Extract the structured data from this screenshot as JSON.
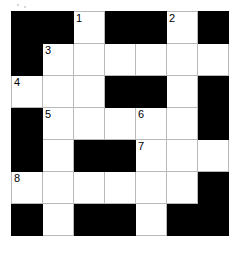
{
  "puzzle": {
    "type": "crossword-grid",
    "rows": 7,
    "columns": 7,
    "cell_size_px": 31,
    "colors": {
      "block": "#000000",
      "open": "#ffffff",
      "grid_line": "#b9b9b9",
      "number_text": "#000000",
      "page_background": "#ffffff"
    },
    "grid": [
      [
        {
          "state": "block",
          "number": ""
        },
        {
          "state": "block",
          "number": ""
        },
        {
          "state": "open",
          "number": "1"
        },
        {
          "state": "block",
          "number": ""
        },
        {
          "state": "block",
          "number": ""
        },
        {
          "state": "open",
          "number": "2"
        },
        {
          "state": "block",
          "number": ""
        }
      ],
      [
        {
          "state": "block",
          "number": ""
        },
        {
          "state": "open",
          "number": "3"
        },
        {
          "state": "open",
          "number": ""
        },
        {
          "state": "open",
          "number": ""
        },
        {
          "state": "open",
          "number": ""
        },
        {
          "state": "open",
          "number": ""
        },
        {
          "state": "open",
          "number": ""
        }
      ],
      [
        {
          "state": "open",
          "number": "4"
        },
        {
          "state": "open",
          "number": ""
        },
        {
          "state": "open",
          "number": ""
        },
        {
          "state": "block",
          "number": ""
        },
        {
          "state": "block",
          "number": ""
        },
        {
          "state": "open",
          "number": ""
        },
        {
          "state": "block",
          "number": ""
        }
      ],
      [
        {
          "state": "block",
          "number": ""
        },
        {
          "state": "open",
          "number": "5"
        },
        {
          "state": "open",
          "number": ""
        },
        {
          "state": "open",
          "number": ""
        },
        {
          "state": "open",
          "number": "6"
        },
        {
          "state": "open",
          "number": ""
        },
        {
          "state": "block",
          "number": ""
        }
      ],
      [
        {
          "state": "block",
          "number": ""
        },
        {
          "state": "open",
          "number": ""
        },
        {
          "state": "block",
          "number": ""
        },
        {
          "state": "block",
          "number": ""
        },
        {
          "state": "open",
          "number": "7"
        },
        {
          "state": "open",
          "number": ""
        },
        {
          "state": "open",
          "number": ""
        }
      ],
      [
        {
          "state": "open",
          "number": "8"
        },
        {
          "state": "open",
          "number": ""
        },
        {
          "state": "open",
          "number": ""
        },
        {
          "state": "open",
          "number": ""
        },
        {
          "state": "open",
          "number": ""
        },
        {
          "state": "open",
          "number": ""
        },
        {
          "state": "block",
          "number": ""
        }
      ],
      [
        {
          "state": "block",
          "number": ""
        },
        {
          "state": "open",
          "number": ""
        },
        {
          "state": "block",
          "number": ""
        },
        {
          "state": "block",
          "number": ""
        },
        {
          "state": "open",
          "number": ""
        },
        {
          "state": "block",
          "number": ""
        },
        {
          "state": "block",
          "number": ""
        }
      ]
    ]
  }
}
